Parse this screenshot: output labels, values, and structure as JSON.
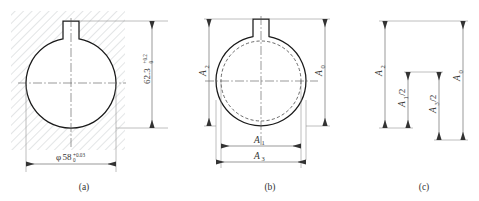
{
  "figure": {
    "panels": [
      {
        "id": "a",
        "caption": "(a)",
        "type": "sectioned-part",
        "description": "Hatched part section containing a circular bore with a keyway notch at top",
        "dimensions": [
          {
            "name": "bore-diameter",
            "symbol": "φ",
            "nominal": "58",
            "tolerance_upper": "+0.03",
            "tolerance_lower": "0",
            "orientation": "horizontal",
            "position": "below"
          },
          {
            "name": "keyway-depth-total",
            "symbol": "",
            "nominal": "62.3",
            "tolerance_upper": "+0.2",
            "tolerance_lower": "0",
            "orientation": "vertical",
            "position": "right"
          }
        ]
      },
      {
        "id": "b",
        "caption": "(b)",
        "type": "machining-stage",
        "description": "Bore outline with dashed pre-machining circle, showing chain dimensions",
        "dimensions": [
          {
            "name": "A2",
            "label": "A",
            "subscript": "2",
            "orientation": "vertical",
            "position": "left"
          },
          {
            "name": "A0",
            "label": "A",
            "subscript": "0",
            "orientation": "vertical",
            "position": "right"
          },
          {
            "name": "A1",
            "label": "A",
            "subscript": "1",
            "orientation": "horizontal",
            "position": "bottom-inner"
          },
          {
            "name": "A3",
            "label": "A",
            "subscript": "3",
            "orientation": "horizontal",
            "position": "bottom-outer"
          }
        ]
      },
      {
        "id": "c",
        "caption": "(c)",
        "type": "dimension-chain",
        "description": "Abstract dimension chain linking A2, A1/2, A3/2 and closing link A0",
        "links": [
          {
            "name": "A2",
            "label": "A",
            "subscript": "2",
            "divisor": "",
            "role": "component"
          },
          {
            "name": "A1-half",
            "label": "A",
            "subscript": "1",
            "divisor": "/2",
            "role": "component"
          },
          {
            "name": "A3-half",
            "label": "A",
            "subscript": "3",
            "divisor": "/2",
            "role": "component"
          },
          {
            "name": "A0",
            "label": "A",
            "subscript": "0",
            "divisor": "",
            "role": "closing-link"
          }
        ]
      }
    ],
    "colors": {
      "outline": "#1a1a1a",
      "hatch": "#9aa0a6",
      "dimension": "#555555",
      "text": "#333333",
      "background": "#ffffff"
    }
  }
}
